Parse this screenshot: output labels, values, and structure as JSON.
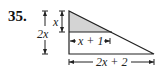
{
  "problem": {
    "number": "35."
  },
  "diagram": {
    "type": "right-triangle-with-shaded-similar-triangle",
    "labels": {
      "small_height": "x",
      "large_height": "2x",
      "small_base": "x + 1",
      "large_base": "2x + 2"
    },
    "colors": {
      "stroke": "#222222",
      "shaded_fill": "#d4d4d4"
    }
  }
}
